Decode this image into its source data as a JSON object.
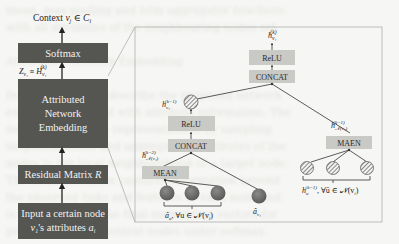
{
  "left_stack": {
    "output_label": "Context v_j ∈ C_i",
    "softmax": "Softmax",
    "z_label": "Z_{v_i} ≡ H_{v_i}^{(k)}",
    "embedding_lines": [
      "Attributed",
      "Network",
      "Embedding"
    ],
    "residual": "Residual Matrix R",
    "input_lines": [
      "Input a  certain node",
      "v_i 's  attributes a_i"
    ]
  },
  "inset": {
    "top_output": "h_{v_i}^{(k)}",
    "top_relu": "ReLU",
    "top_concat": "CONCAT",
    "left_hidden": "h_{v_i}^{(k-1)}",
    "right_hidden": "h_{N(v_i)}^{(k-1)}",
    "mid_relu": "ReLU",
    "mid_concat": "CONCAT",
    "mean_hidden": "h_{N(v_i)}^{(k-2)}",
    "mean": "MEAN",
    "maen": "MAEN",
    "bottom_left_label": "â_u, ∀u ∈ N(v_i)",
    "self_attr_label": "â_{v_i}",
    "bottom_right_label": "h_ū^{(k-1)}, ∀ū ∈ N(v_i)"
  },
  "colors": {
    "dark_box": "#555552",
    "gray_box": "#c9c9c6",
    "node_dark": "#6a6a68",
    "background": "#f6f6f4"
  },
  "ghost_text": "mean, max-pooling and lstm aggregator functions.\nwith all attributes of the neighbouring nodes set\n\nAttributed Network Embedding\n\nIn this section we describe the proposed network\nembedding method with attribute information. The\nmodel learns node representations by sampling\nneighbourhoods and aggregating attributes of the\nnodes in the local neighbourhood of a target node.\nThe residual matrix captures information beyond\nthe observed links and features of each node and\nis combined into the final embedding vectors for\nprediction of the context nodes under softmax."
}
